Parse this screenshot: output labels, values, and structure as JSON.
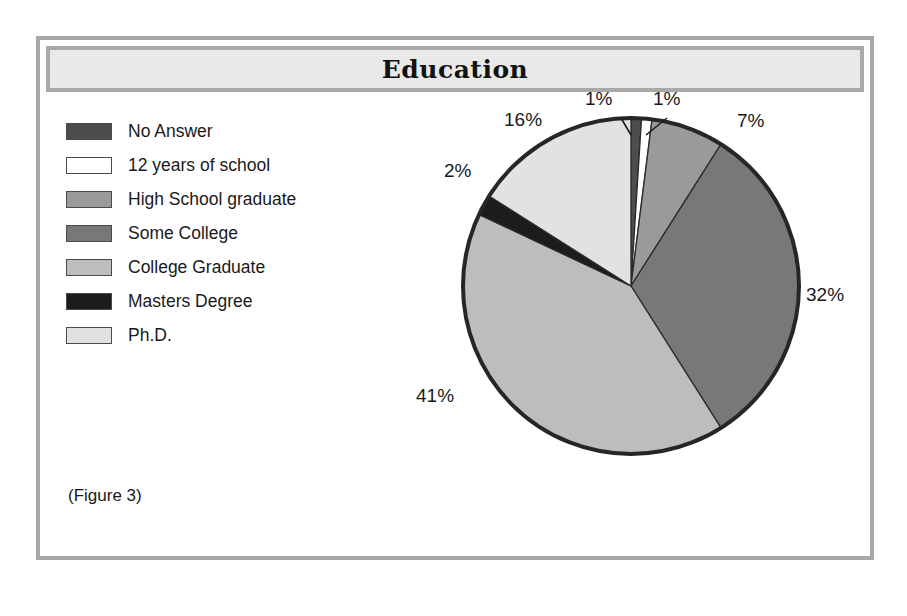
{
  "figure": {
    "title": "Education",
    "caption": "(Figure 3)"
  },
  "legend": {
    "items": [
      {
        "label": "No Answer",
        "color": "#4d4d4d"
      },
      {
        "label": "12 years of school",
        "color": "#ffffff"
      },
      {
        "label": "High School graduate",
        "color": "#9a9a9a"
      },
      {
        "label": "Some College",
        "color": "#787878"
      },
      {
        "label": "College Graduate",
        "color": "#bdbdbd"
      },
      {
        "label": "Masters Degree",
        "color": "#1c1c1c"
      },
      {
        "label": "Ph.D.",
        "color": "#e2e2e2"
      }
    ]
  },
  "labels": {
    "no_answer": "1%",
    "twelve_years": "1%",
    "high_school": "7%",
    "some_college": "32%",
    "college_graduate": "41%",
    "masters": "2%",
    "phd": "16%"
  },
  "chart_data": {
    "type": "pie",
    "title": "Education",
    "categories": [
      "No Answer",
      "12 years of school",
      "High School graduate",
      "Some College",
      "College Graduate",
      "Masters Degree",
      "Ph.D."
    ],
    "values": [
      1,
      1,
      7,
      32,
      41,
      2,
      16
    ],
    "value_labels": [
      "1%",
      "1%",
      "7%",
      "32%",
      "41%",
      "2%",
      "16%"
    ],
    "colors": [
      "#4d4d4d",
      "#ffffff",
      "#9a9a9a",
      "#787878",
      "#bdbdbd",
      "#1c1c1c",
      "#e2e2e2"
    ],
    "units": "percent",
    "start_angle": 0,
    "direction": "clockwise",
    "legend_position": "left",
    "grid": false,
    "annotations": [
      "(Figure 3)"
    ]
  }
}
